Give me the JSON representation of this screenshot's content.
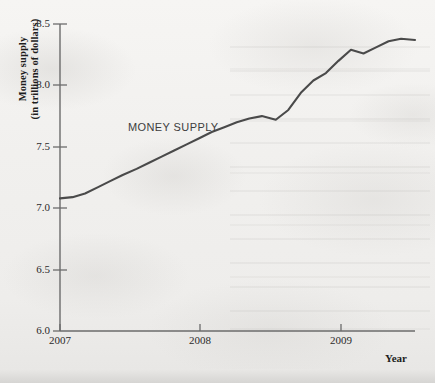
{
  "figure": {
    "y_axis_title_line1": "Money supply",
    "y_axis_title_line2": "(in trillions of dollars)",
    "x_axis_title": "Year",
    "series_label": "MONEY SUPPLY",
    "line_color": "#4a4a4a",
    "axis_color": "#6b6b6b",
    "text_color": "#1d1d1d",
    "background_color": "#f2f2f0"
  },
  "chart_data": {
    "type": "line",
    "title": "",
    "xlabel": "Year",
    "ylabel": "Money supply (in trillions of dollars)",
    "xlim": [
      2007.0,
      2009.55
    ],
    "ylim": [
      6.0,
      8.5
    ],
    "grid": false,
    "legend": "inline-label",
    "xticks": [
      2007,
      2008,
      2009
    ],
    "xtick_labels": [
      "2007",
      "2008",
      "2009"
    ],
    "yticks": [
      6.0,
      6.5,
      7.0,
      7.5,
      8.0,
      8.5
    ],
    "ytick_labels": [
      "6.0",
      "6.5",
      "7.0",
      "7.5",
      "8.0",
      "8.5"
    ],
    "series": [
      {
        "name": "MONEY SUPPLY",
        "x": [
          2007.0,
          2007.09,
          2007.18,
          2007.27,
          2007.36,
          2007.45,
          2007.55,
          2007.64,
          2007.73,
          2007.82,
          2007.91,
          2008.0,
          2008.09,
          2008.18,
          2008.27,
          2008.36,
          2008.45,
          2008.55,
          2008.64,
          2008.73,
          2008.82,
          2008.91,
          2009.0,
          2009.09,
          2009.18,
          2009.27,
          2009.36,
          2009.45,
          2009.55
        ],
        "y": [
          7.08,
          7.09,
          7.12,
          7.17,
          7.22,
          7.27,
          7.32,
          7.37,
          7.42,
          7.47,
          7.52,
          7.57,
          7.62,
          7.66,
          7.7,
          7.73,
          7.75,
          7.72,
          7.8,
          7.94,
          8.04,
          8.1,
          8.2,
          8.29,
          8.26,
          8.31,
          8.36,
          8.38,
          8.37
        ]
      }
    ]
  },
  "geometry": {
    "plot_left": 60,
    "plot_right": 415,
    "plot_top": 24,
    "plot_bottom": 331,
    "x_tick_px": [
      60,
      200,
      341
    ],
    "y_tick_px": [
      331,
      270,
      208,
      147,
      85,
      24
    ]
  }
}
